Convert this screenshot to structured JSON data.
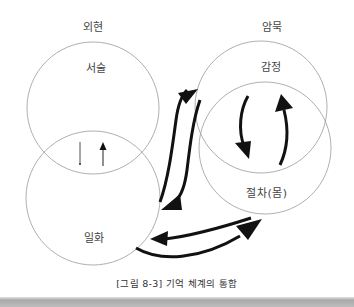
{
  "figure": {
    "caption": "[그림 8-3]  기억 체계의 통합",
    "groups": {
      "explicit": {
        "label": "외현"
      },
      "implicit": {
        "label": "암묵"
      }
    },
    "circles": {
      "narrative": {
        "label": "서술"
      },
      "episodic": {
        "label": "일화"
      },
      "emotion": {
        "label": "감정"
      },
      "procedural": {
        "label": "절차(몸)"
      }
    },
    "arrows": [
      {
        "from": "narrative",
        "to": "episodic",
        "style": "thin",
        "direction": "down"
      },
      {
        "from": "episodic",
        "to": "narrative",
        "style": "thin",
        "direction": "up"
      },
      {
        "from": "episodic",
        "to": "emotion",
        "style": "bold"
      },
      {
        "from": "emotion",
        "to": "episodic",
        "style": "bold"
      },
      {
        "from": "emotion",
        "to": "procedural",
        "style": "bold"
      },
      {
        "from": "procedural",
        "to": "emotion",
        "style": "bold"
      },
      {
        "from": "procedural",
        "to": "episodic",
        "style": "bold"
      },
      {
        "from": "episodic",
        "to": "procedural",
        "style": "bold"
      }
    ],
    "colors": {
      "circle_stroke": "#9a9a9a",
      "arrow": "#111111",
      "text": "#444444"
    }
  }
}
